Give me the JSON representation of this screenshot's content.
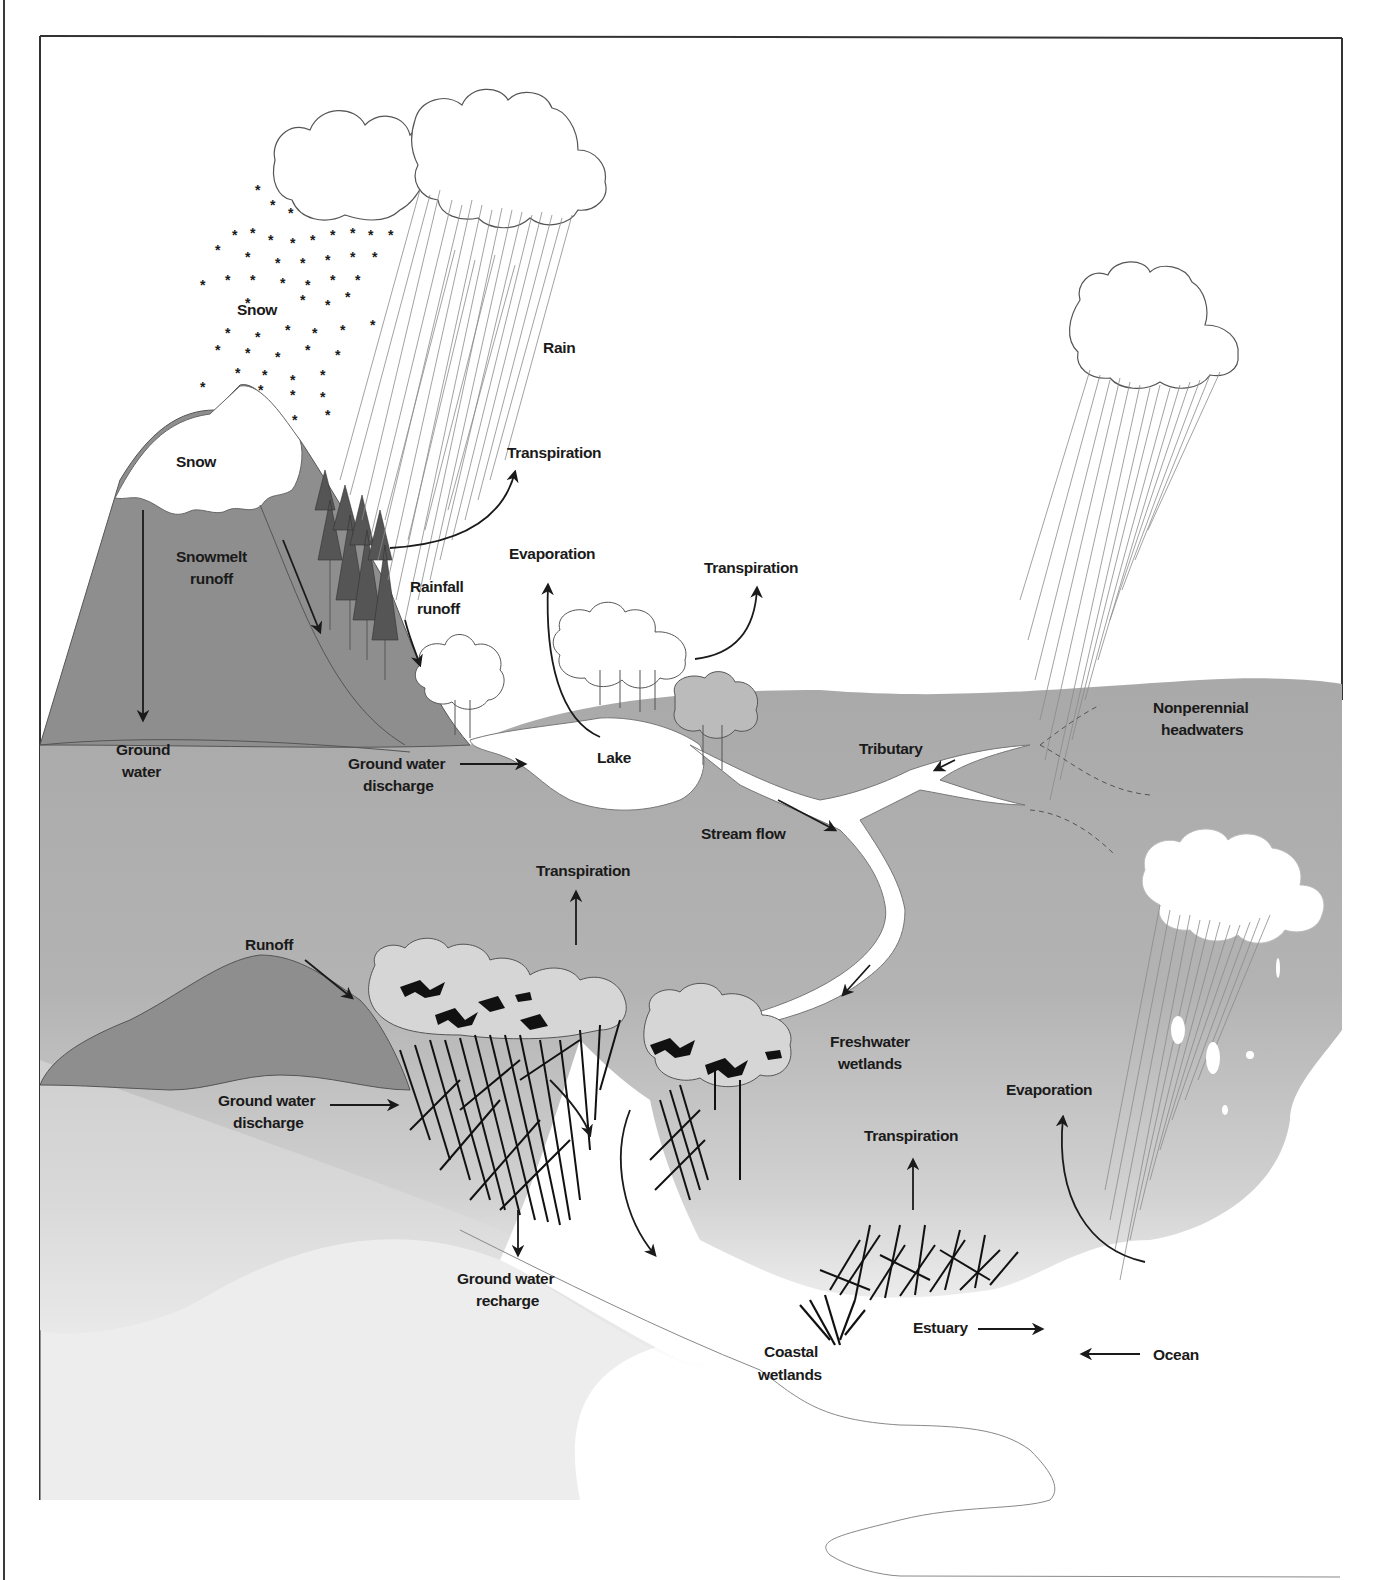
{
  "diagram": {
    "colors": {
      "frame": "#333333",
      "mountain": "#8c8c8c",
      "ground_upper": "#aaaaaa",
      "ground_mid": "#b4b4b4",
      "ground_lower": "#dcdcdc",
      "water": "#ffffff",
      "text": "#1a1a1a"
    },
    "labels": {
      "snow_sky": "Snow",
      "rain": "Rain",
      "snow_peak": "Snow",
      "transpiration_forest": "Transpiration",
      "snowmelt_runoff_1": "Snowmelt",
      "snowmelt_runoff_2": "runoff",
      "evaporation_lake": "Evaporation",
      "transpiration_trees": "Transpiration",
      "rainfall_runoff_1": "Rainfall",
      "rainfall_runoff_2": "runoff",
      "ground_water_1": "Ground",
      "ground_water_2": "water",
      "gw_discharge_lake_1": "Ground water",
      "gw_discharge_lake_2": "discharge",
      "lake": "Lake",
      "tributary": "Tributary",
      "nonperennial_1": "Nonperennial",
      "nonperennial_2": "headwaters",
      "stream_flow": "Stream flow",
      "transpiration_wetland": "Transpiration",
      "runoff": "Runoff",
      "freshwater_wetlands_1": "Freshwater",
      "freshwater_wetlands_2": "wetlands",
      "evaporation_ocean": "Evaporation",
      "gw_discharge_wetland_1": "Ground water",
      "gw_discharge_wetland_2": "discharge",
      "transpiration_marsh": "Transpiration",
      "gw_recharge_1": "Ground water",
      "gw_recharge_2": "recharge",
      "estuary": "Estuary",
      "ocean": "Ocean",
      "coastal_wetlands_1": "Coastal",
      "coastal_wetlands_2": "wetlands"
    }
  }
}
